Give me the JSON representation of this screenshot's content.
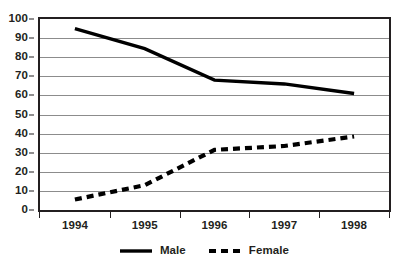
{
  "chart_data": {
    "type": "line",
    "title": "",
    "xlabel": "",
    "ylabel": "",
    "categories": [
      "1994",
      "1995",
      "1996",
      "1997",
      "1998"
    ],
    "ylim": [
      0,
      100
    ],
    "y_ticks": [
      0,
      10,
      20,
      30,
      40,
      50,
      60,
      70,
      80,
      90,
      100
    ],
    "grid": "horizontal",
    "legend_position": "bottom-center",
    "series": [
      {
        "name": "Male",
        "style": "solid",
        "color": "#000000",
        "values": [
          95,
          84.5,
          68,
          66,
          61
        ]
      },
      {
        "name": "Female",
        "style": "dashed",
        "color": "#000000",
        "values": [
          5.5,
          13,
          31.5,
          33.5,
          38.5
        ]
      }
    ]
  },
  "axes": {
    "y_tick_labels": [
      "100",
      "90",
      "80",
      "70",
      "60",
      "50",
      "40",
      "30",
      "20",
      "10",
      "0"
    ],
    "x_tick_labels": [
      "1994",
      "1995",
      "1996",
      "1997",
      "1998"
    ]
  },
  "legend": {
    "entries": [
      {
        "label": "Male",
        "swatch": "solid-line-swatch"
      },
      {
        "label": "Female",
        "swatch": "dashed-line-swatch"
      }
    ]
  },
  "colors": {
    "ink": "#231f20",
    "gridline": "#8c8c8c",
    "series": "#000000",
    "background": "#ffffff"
  }
}
